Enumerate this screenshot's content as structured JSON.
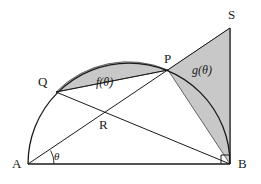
{
  "figure": {
    "type": "geometry-diagram",
    "width": 261,
    "height": 184,
    "background_color": "#ffffff",
    "stroke_color": "#1a1a1a",
    "shade_color": "#c8c8c8",
    "shade_stroke_color": "#555555"
  },
  "points": {
    "A": {
      "label": "A",
      "x": 28,
      "y": 164,
      "label_x": 12,
      "label_y": 157
    },
    "B": {
      "label": "B",
      "x": 230,
      "y": 164,
      "label_x": 238,
      "label_y": 157
    },
    "P": {
      "label": "P",
      "x": 168,
      "y": 70,
      "label_x": 164,
      "label_y": 52
    },
    "Q": {
      "label": "Q",
      "x": 56,
      "y": 92,
      "label_x": 38,
      "label_y": 75
    },
    "R": {
      "label": "R",
      "x": 103,
      "y": 115,
      "label_x": 99,
      "label_y": 118
    },
    "S": {
      "label": "S",
      "x": 230,
      "y": 28,
      "label_x": 228,
      "label_y": 8
    }
  },
  "regions": {
    "f": {
      "label": "f(θ)",
      "label_x": 96,
      "label_y": 76
    },
    "g": {
      "label": "g(θ)",
      "label_x": 192,
      "label_y": 64
    }
  },
  "angle": {
    "label": "θ",
    "vertex": "A",
    "label_x": 54,
    "label_y": 151,
    "arc_radius": 26
  },
  "segments": [
    {
      "name": "diameter-AB",
      "from": "A",
      "to": "B"
    },
    {
      "name": "ray-AS",
      "from": "A",
      "to": "S"
    },
    {
      "name": "chord-QB",
      "from": "Q",
      "to": "B"
    },
    {
      "name": "chord-QP",
      "from": "Q",
      "to": "P"
    },
    {
      "name": "side-SB",
      "from": "S",
      "to": "B"
    }
  ],
  "arcs": [
    {
      "name": "semicircle-AB",
      "center_x": 129,
      "center_y": 164,
      "radius": 101
    }
  ],
  "markers": [
    {
      "name": "right-angle-at-B",
      "x": 230,
      "y": 164,
      "size": 9
    }
  ]
}
